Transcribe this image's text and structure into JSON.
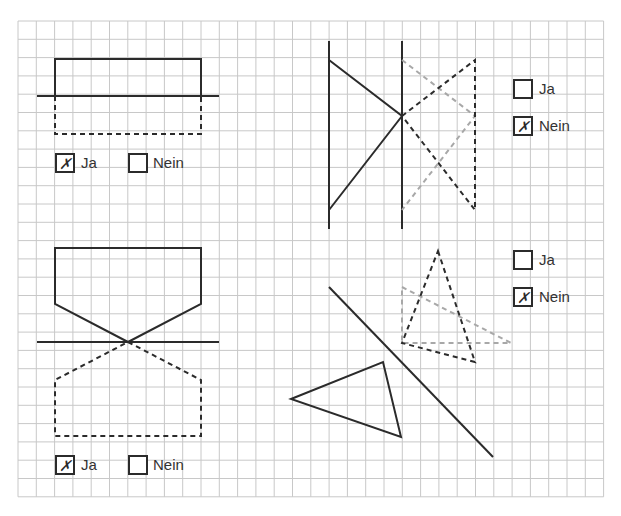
{
  "grid": {
    "x0": 18,
    "y0": 21,
    "cols": 32,
    "rows": 26,
    "cell": 18.3,
    "line_color": "#c8c8c8"
  },
  "colors": {
    "solid": "#2b2b2b",
    "dashed_dark": "#2b2b2b",
    "dashed_gray": "#a8a8a8"
  },
  "check_mark": "✗",
  "panels": [
    {
      "id": "top-left",
      "question": {
        "options": [
          {
            "label": "Ja",
            "checked": true
          },
          {
            "label": "Nein",
            "checked": false
          }
        ]
      }
    },
    {
      "id": "top-right",
      "question": {
        "options": [
          {
            "label": "Ja",
            "checked": false
          },
          {
            "label": "Nein",
            "checked": true
          }
        ]
      }
    },
    {
      "id": "bottom-left",
      "question": {
        "options": [
          {
            "label": "Ja",
            "checked": true
          },
          {
            "label": "Nein",
            "checked": false
          }
        ]
      }
    },
    {
      "id": "bottom-right",
      "question": {
        "options": [
          {
            "label": "Ja",
            "checked": false
          },
          {
            "label": "Nein",
            "checked": true
          }
        ]
      }
    }
  ]
}
